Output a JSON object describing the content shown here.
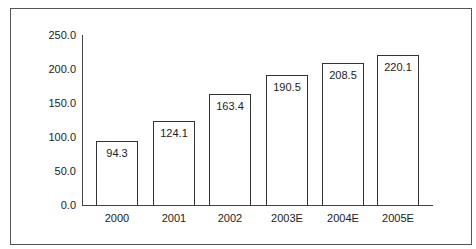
{
  "chart_data": {
    "type": "bar",
    "title": "",
    "xlabel": "",
    "ylabel": "",
    "categories": [
      "2000",
      "2001",
      "2002",
      "2003E",
      "2004E",
      "2005E"
    ],
    "values": [
      94.3,
      124.1,
      163.4,
      190.5,
      208.5,
      220.1
    ],
    "value_labels": [
      "94.3",
      "124.1",
      "163.4",
      "190.5",
      "208.5",
      "220.1"
    ],
    "ylim": [
      0,
      250
    ],
    "yticks": [
      "0.0",
      "50.0",
      "100.0",
      "150.0",
      "200.0",
      "250.0"
    ],
    "grid": false,
    "legend": null,
    "bar_fill": "#ffffff",
    "bar_stroke": "#333333"
  }
}
